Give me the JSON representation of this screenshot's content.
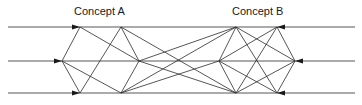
{
  "labels": {
    "concept_a": "Concept A",
    "concept_b": "Concept B"
  },
  "colors": {
    "line": "#2b2b2b",
    "background": "#ffffff",
    "text": "#1a1a1a"
  },
  "nodes": {
    "A_top_outer": [
      80,
      27
    ],
    "A_mid_outer": [
      62,
      61
    ],
    "A_bot_outer": [
      80,
      93
    ],
    "A_top_inner": [
      121,
      27
    ],
    "A_mid_inner": [
      139,
      61
    ],
    "A_bot_inner": [
      121,
      93
    ],
    "B_top_inner": [
      236,
      27
    ],
    "B_mid_inner": [
      219,
      61
    ],
    "B_bot_inner": [
      236,
      93
    ],
    "B_top_outer": [
      277,
      27
    ],
    "B_mid_outer": [
      295,
      61
    ],
    "B_bot_outer": [
      277,
      93
    ]
  },
  "inputs_left": [
    {
      "from": [
        8,
        27
      ],
      "to": [
        80,
        27
      ]
    },
    {
      "from": [
        8,
        61
      ],
      "to": [
        62,
        61
      ]
    },
    {
      "from": [
        8,
        93
      ],
      "to": [
        80,
        93
      ]
    }
  ],
  "inputs_right": [
    {
      "from": [
        355,
        27
      ],
      "to": [
        277,
        27
      ]
    },
    {
      "from": [
        355,
        61
      ],
      "to": [
        295,
        61
      ]
    },
    {
      "from": [
        355,
        93
      ],
      "to": [
        277,
        93
      ]
    }
  ]
}
